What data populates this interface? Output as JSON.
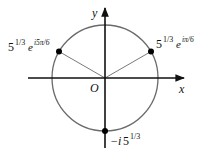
{
  "diagram": {
    "type": "complex-plane-roots",
    "axes": {
      "x_label": "x",
      "y_label": "y",
      "origin_label": "O"
    },
    "circle": {
      "center": [
        105,
        78
      ],
      "radius": 53,
      "color": "#6a6a6a"
    },
    "points": [
      {
        "id": "root-pi-6",
        "label_base": "5",
        "label_exp": "1/3",
        "label_e": "e",
        "label_e_exp": "iπ/6",
        "angle_deg": 30
      },
      {
        "id": "root-5pi-6",
        "label_base": "5",
        "label_exp": "1/3",
        "label_e": "e",
        "label_e_exp": "i5π/6",
        "angle_deg": 150
      },
      {
        "id": "root-neg-i",
        "label_prefix": "−i",
        "label_base": "5",
        "label_exp": "1/3",
        "angle_deg": 270
      }
    ],
    "colors": {
      "axis": "#111111",
      "circle": "#6a6a6a",
      "ray": "#7a7a7a",
      "point": "#000000"
    }
  }
}
